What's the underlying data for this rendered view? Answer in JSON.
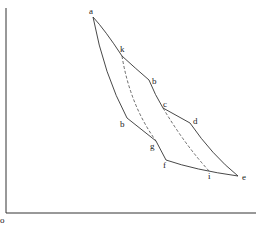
{
  "diagram": {
    "type": "thermodynamic indicator-style curve diagram",
    "axes": {
      "origin_label": "o",
      "vertical_axis": {
        "x": 6,
        "y_top": 8,
        "y_bottom": 213
      },
      "horizontal_axis": {
        "y": 213,
        "x_left": 6,
        "x_right": 256
      }
    },
    "points": [
      {
        "id": "a",
        "label": "a",
        "x": 93,
        "y": 17
      },
      {
        "id": "k",
        "label": "k",
        "x": 122,
        "y": 56
      },
      {
        "id": "b_upper",
        "label": "b",
        "x": 149,
        "y": 80
      },
      {
        "id": "b_lower",
        "label": "b",
        "x": 127,
        "y": 118
      },
      {
        "id": "c",
        "label": "c",
        "x": 163,
        "y": 108
      },
      {
        "id": "d",
        "label": "d",
        "x": 190,
        "y": 123
      },
      {
        "id": "g",
        "label": "g",
        "x": 156,
        "y": 141
      },
      {
        "id": "f",
        "label": "f",
        "x": 166,
        "y": 160
      },
      {
        "id": "i",
        "label": "i",
        "x": 210,
        "y": 172
      },
      {
        "id": "e",
        "label": "e",
        "x": 238,
        "y": 176
      }
    ],
    "labels": [
      {
        "text": "a",
        "x": 89,
        "y": 7
      },
      {
        "text": "k",
        "x": 120,
        "y": 45
      },
      {
        "text": "b",
        "x": 152,
        "y": 77
      },
      {
        "text": "b",
        "x": 120,
        "y": 120
      },
      {
        "text": "c",
        "x": 163,
        "y": 100
      },
      {
        "text": "d",
        "x": 193,
        "y": 117
      },
      {
        "text": "g",
        "x": 150,
        "y": 142
      },
      {
        "text": "f",
        "x": 163,
        "y": 161
      },
      {
        "text": "i",
        "x": 208,
        "y": 172
      },
      {
        "text": "e",
        "x": 242,
        "y": 173
      },
      {
        "text": "o",
        "x": 0,
        "y": 216
      }
    ],
    "paths": {
      "solid": [
        "M93,17 Q105,30 122,56",
        "M122,56 Q135,68 149,80",
        "M149,80 Q155,95 163,108",
        "M163,108 L190,123",
        "M190,123 Q212,155 238,176",
        "M93,17 Q104,75 127,118",
        "M127,118 L156,141",
        "M156,141 L166,160",
        "M166,160 Q195,170 238,176"
      ],
      "dashed": [
        "M122,56 Q130,105 156,141",
        "M163,108 Q185,145 210,172"
      ]
    }
  }
}
